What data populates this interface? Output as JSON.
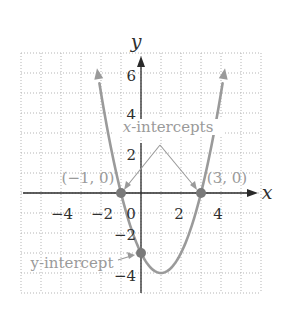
{
  "chart_data": {
    "type": "line",
    "title": "",
    "function": "y = x^2 - 2x - 3",
    "xlabel": "x",
    "ylabel": "y",
    "xlim": [
      -6,
      6
    ],
    "ylim": [
      -5,
      7
    ],
    "grid": true,
    "x_ticks": [
      {
        "value": -4,
        "label": "−4"
      },
      {
        "value": -2,
        "label": "−2"
      },
      {
        "value": 0,
        "label": "0"
      },
      {
        "value": 2,
        "label": "2"
      },
      {
        "value": 4,
        "label": "4"
      }
    ],
    "y_ticks": [
      {
        "value": 6,
        "label": "6"
      },
      {
        "value": 4,
        "label": "4"
      },
      {
        "value": 2,
        "label": "2"
      },
      {
        "value": -2,
        "label": "−2"
      },
      {
        "value": -4,
        "label": "−4"
      }
    ],
    "series": [
      {
        "name": "parabola",
        "x": [
          -2.2,
          -2,
          -1.5,
          -1,
          -0.5,
          0,
          0.5,
          1,
          1.5,
          2,
          2.5,
          3,
          3.5,
          4,
          4.2
        ],
        "y": [
          6.24,
          5,
          2.25,
          0,
          -1.75,
          -3,
          -3.75,
          -4,
          -3.75,
          -3,
          -1.75,
          0,
          2.25,
          5,
          6.24
        ]
      }
    ],
    "points": [
      {
        "x": -1,
        "y": 0,
        "label": "(−1, 0)"
      },
      {
        "x": 3,
        "y": 0,
        "label": "(3, 0)"
      },
      {
        "x": 0,
        "y": -3,
        "label": ""
      }
    ],
    "annotations": [
      {
        "text_italic": "x",
        "text": "-intercepts",
        "targets": [
          [
            -1,
            0
          ],
          [
            3,
            0
          ]
        ]
      },
      {
        "text": "y-intercept",
        "target": [
          0,
          -3
        ]
      }
    ]
  },
  "colors": {
    "curve": "#9a9a9a",
    "axis": "#2a2a2a",
    "grid": "#b5b5b5",
    "points": "#7a7a7a",
    "annotation": "#9a9a9a"
  }
}
